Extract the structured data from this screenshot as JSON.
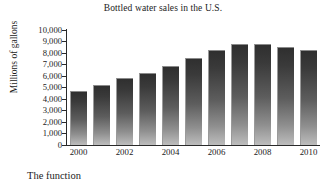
{
  "caption": "The function",
  "chart_data": {
    "type": "bar",
    "title": "Bottled water sales in the U.S.",
    "xlabel": "",
    "ylabel": "Millions of gallons",
    "categories": [
      "2000",
      "2001",
      "2002",
      "2003",
      "2004",
      "2005",
      "2006",
      "2007",
      "2008",
      "2009",
      "2010"
    ],
    "x_tick_labels": [
      "2000",
      "2002",
      "2004",
      "2006",
      "2008",
      "2010"
    ],
    "values": [
      4700,
      5200,
      5800,
      6300,
      6900,
      7600,
      8300,
      8800,
      8800,
      8500,
      8300
    ],
    "ylim": [
      0,
      10000
    ],
    "y_tick_labels": [
      "10,000",
      "9,000",
      "8,000",
      "7,000",
      "6,000",
      "5,000",
      "4,000",
      "3,000",
      "2,000",
      "1,000",
      "0"
    ],
    "y_tick_values": [
      10000,
      9000,
      8000,
      7000,
      6000,
      5000,
      4000,
      3000,
      2000,
      1000,
      0
    ],
    "grid": false,
    "legend": "none",
    "bar_color_top": "#2f2f2f",
    "bar_color_bottom": "#bdbdbd",
    "axis_color": "#2a2a2a",
    "background": "#ffffff"
  }
}
